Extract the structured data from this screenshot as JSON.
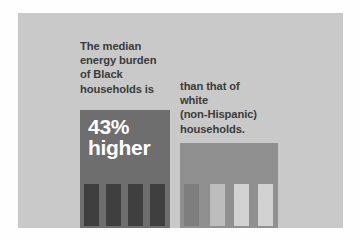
{
  "graphic": {
    "type": "pictogram-comparison-infographic",
    "background_color": "#ffffff",
    "panel_color": "#c9c9c9"
  },
  "copy_left": {
    "lines": [
      "The median",
      "energy burden",
      "of Black",
      "households is"
    ],
    "color": "#3b3b3b"
  },
  "copy_right": {
    "lines": [
      "than that of",
      "white",
      "(non-Hispanic)",
      "households."
    ],
    "color": "#3b3b3b"
  },
  "stat": {
    "value": "43%",
    "qualifier": "higher",
    "color": "#ffffff"
  },
  "bars": [
    {
      "id": "black-households",
      "label": "Black households",
      "color": "#6e6e6e",
      "relative_height": 1.0,
      "figure_count": 4,
      "figure_color": "#3f3f3f"
    },
    {
      "id": "white-households",
      "label": "white (non-Hispanic) households",
      "color": "#909090",
      "relative_height": 0.72,
      "figure_count": 4,
      "figure_color": "#d2d2d2"
    }
  ],
  "figures_left": [
    {
      "shade": "fig-dark"
    },
    {
      "shade": "fig-dark"
    },
    {
      "shade": "fig-dark"
    },
    {
      "shade": "fig-dark"
    }
  ],
  "figures_right": [
    {
      "shade": "fig-dim"
    },
    {
      "shade": "fig-pale"
    },
    {
      "shade": "fig-light"
    },
    {
      "shade": "fig-light"
    }
  ]
}
